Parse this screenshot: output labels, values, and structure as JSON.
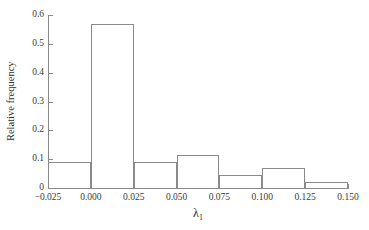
{
  "chart_data": {
    "type": "bar",
    "title": "",
    "xlabel": "λ",
    "xlabel_sub": "1",
    "ylabel": "Relative frequency",
    "bin_edges": [
      -0.025,
      0.0,
      0.025,
      0.05,
      0.075,
      0.1,
      0.125,
      0.15
    ],
    "bin_width": 0.025,
    "categories": [
      "-0.025–0.000",
      "0.000–0.025",
      "0.025–0.050",
      "0.050–0.075",
      "0.075–0.100",
      "0.100–0.125",
      "0.125–0.150"
    ],
    "values": [
      0.09,
      0.57,
      0.09,
      0.115,
      0.045,
      0.068,
      0.022
    ],
    "xlim": [
      -0.025,
      0.15
    ],
    "ylim": [
      0,
      0.6
    ],
    "xticks": [
      -0.025,
      0.0,
      0.025,
      0.05,
      0.075,
      0.1,
      0.125,
      0.15
    ],
    "xtick_labels": [
      "−0.025",
      "0.000",
      "0.025",
      "0.050",
      "0.075",
      "0.100",
      "0.125",
      "0.150"
    ],
    "yticks": [
      0,
      0.1,
      0.2,
      0.3,
      0.4,
      0.5,
      0.6
    ],
    "ytick_labels": [
      "0",
      "0.1",
      "0.2",
      "0.3",
      "0.4",
      "0.5",
      "0.6"
    ],
    "grid": false,
    "legend": null,
    "bar_edge_color": "#8a8a8a",
    "bar_fill_color": "#ffffff",
    "axis_color": "#8a8a8a",
    "text_color": "#2e2e2e"
  }
}
